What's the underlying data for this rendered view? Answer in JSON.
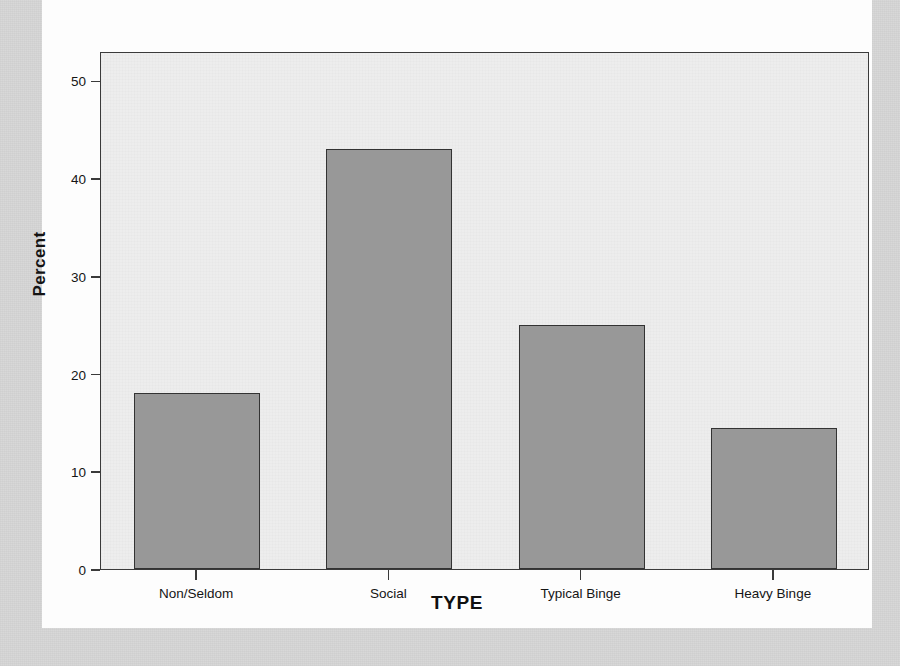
{
  "chart_data": {
    "type": "bar",
    "title": "TYPE",
    "xlabel": "TYPE",
    "ylabel": "Percent",
    "categories": [
      "Non/Seldom",
      "Social",
      "Typical Binge",
      "Heavy Binge"
    ],
    "values": [
      18,
      43,
      25,
      14.4
    ],
    "ylim": [
      0,
      53
    ],
    "yticks": [
      0,
      10,
      20,
      30,
      40,
      50
    ],
    "ytick_labels": [
      "0",
      "10",
      "20",
      "30",
      "40",
      "50"
    ],
    "grid": false,
    "legend": null,
    "bar_fill_color": "#989898",
    "bar_border_color": "#333333",
    "plot_background_color": "#ededed",
    "page_background_color": "#d6d6d6",
    "card_background_color": "#fdfdfd"
  }
}
